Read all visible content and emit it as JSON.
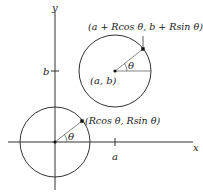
{
  "diagram": {
    "axes": {
      "x_label": "x",
      "y_label": "y",
      "x_tick_label": "a",
      "y_tick_label": "b"
    },
    "upper_circle": {
      "center_label": "(a, b)",
      "point_label": "(a + Rcos θ, b + Rsin θ)",
      "angle_label": "θ"
    },
    "lower_circle": {
      "point_label": "(Rcos θ, Rsin θ)",
      "angle_label": "θ"
    },
    "colors": {
      "stroke": "#333333",
      "radius": "#666666"
    }
  }
}
